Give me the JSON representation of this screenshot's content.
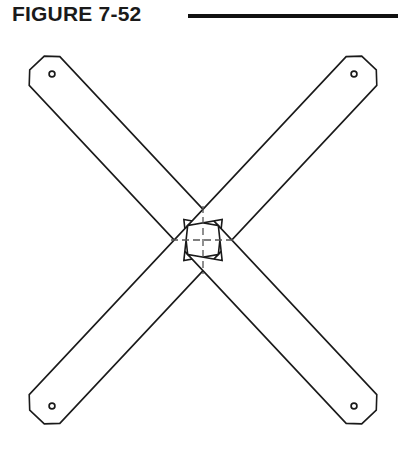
{
  "figure": {
    "label": "FIGURE 7-52",
    "rule_color": "#111111",
    "line_color": "#1a1a1a",
    "background_color": "#ffffff",
    "drawing_name": "x-shaped cross brace"
  },
  "drawing": {
    "center": {
      "x": 203,
      "y": 240
    },
    "line_width": 1.6,
    "arm_half_width": 21,
    "notch_depth": 28,
    "tip_chamfer": 11,
    "hole_radius_outer": 2.9,
    "hole_radius_inner": 1.3,
    "arms": [
      {
        "name": "arm-upper-left",
        "tip": {
          "x": 37,
          "y": 63
        },
        "hole": {
          "x": 52,
          "y": 74
        },
        "angle_deg": 225
      },
      {
        "name": "arm-upper-right",
        "tip": {
          "x": 369,
          "y": 63
        },
        "hole": {
          "x": 354,
          "y": 74
        },
        "angle_deg": 315
      },
      {
        "name": "arm-lower-left",
        "tip": {
          "x": 37,
          "y": 417
        },
        "hole": {
          "x": 52,
          "y": 406
        },
        "angle_deg": 135
      },
      {
        "name": "arm-lower-right",
        "tip": {
          "x": 369,
          "y": 417
        },
        "hole": {
          "x": 354,
          "y": 406
        },
        "angle_deg": 45
      }
    ],
    "center_mark": {
      "name": "center-crosshair",
      "half_length_x": 32,
      "half_length_y": 34,
      "dash": "7 4",
      "line_width": 1.3
    }
  }
}
